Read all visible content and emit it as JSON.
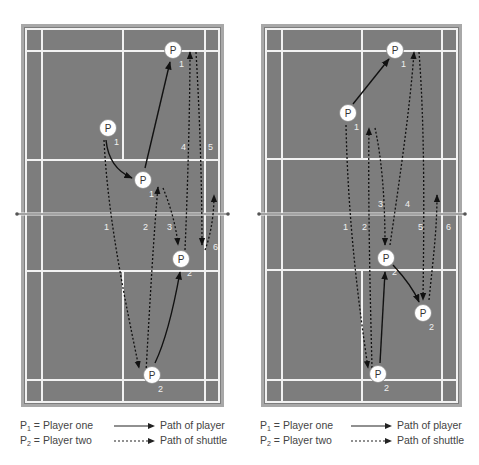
{
  "colors": {
    "court": "#7d7d7d",
    "lines": "#f2f2f2",
    "frame": "#a8a8a8",
    "net": "#555555",
    "path": "#111111",
    "player_fill": "#ffffff",
    "text": "#444444"
  },
  "player_marker": {
    "letter": "P"
  },
  "diagrams": [
    {
      "id": "left",
      "players": [
        {
          "label": "P",
          "sub": "1",
          "x": 108,
          "y": 128
        },
        {
          "label": "P",
          "sub": "1",
          "x": 143,
          "y": 180
        },
        {
          "label": "P",
          "sub": "1",
          "x": 173,
          "y": 50
        },
        {
          "label": "P",
          "sub": "2",
          "x": 181,
          "y": 259
        },
        {
          "label": "P",
          "sub": "2",
          "x": 152,
          "y": 375
        }
      ],
      "shot_numbers": [
        {
          "n": "1",
          "x": 104,
          "y": 230
        },
        {
          "n": "2",
          "x": 143,
          "y": 230
        },
        {
          "n": "3",
          "x": 167,
          "y": 230
        },
        {
          "n": "4",
          "x": 181,
          "y": 150
        },
        {
          "n": "5",
          "x": 208,
          "y": 150
        },
        {
          "n": "6",
          "x": 213,
          "y": 250
        }
      ]
    },
    {
      "id": "right",
      "players": [
        {
          "label": "P",
          "sub": "1",
          "x": 348,
          "y": 113
        },
        {
          "label": "P",
          "sub": "1",
          "x": 395,
          "y": 50
        },
        {
          "label": "P",
          "sub": "2",
          "x": 386,
          "y": 258
        },
        {
          "label": "P",
          "sub": "2",
          "x": 423,
          "y": 313
        },
        {
          "label": "P",
          "sub": "2",
          "x": 378,
          "y": 374
        }
      ],
      "shot_numbers": [
        {
          "n": "1",
          "x": 343,
          "y": 230
        },
        {
          "n": "2",
          "x": 362,
          "y": 230
        },
        {
          "n": "3",
          "x": 378,
          "y": 207
        },
        {
          "n": "4",
          "x": 405,
          "y": 207
        },
        {
          "n": "5",
          "x": 418,
          "y": 230
        },
        {
          "n": "6",
          "x": 446,
          "y": 230
        }
      ]
    }
  ],
  "legends": [
    {
      "p1": {
        "letter": "P",
        "sub": "1",
        "text": "= Player one"
      },
      "p2": {
        "letter": "P",
        "sub": "2",
        "text": "= Player two"
      },
      "player_path": "Path of player",
      "shuttle_path": "Path of shuttle"
    },
    {
      "p1": {
        "letter": "P",
        "sub": "1",
        "text": "= Player one"
      },
      "p2": {
        "letter": "P",
        "sub": "2",
        "text": "= Player two"
      },
      "player_path": "Path of player",
      "shuttle_path": "Path of shuttle"
    }
  ]
}
